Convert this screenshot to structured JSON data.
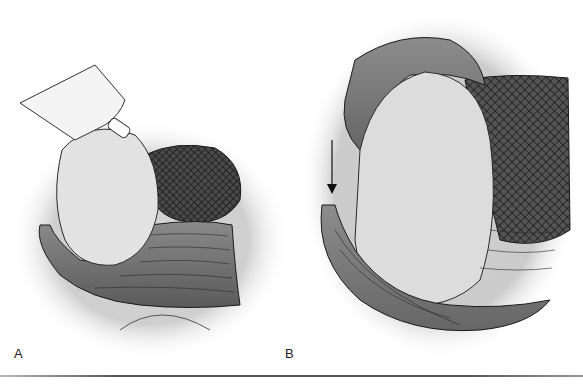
{
  "figure": {
    "panels": [
      {
        "label": "A",
        "description": "Surgical illustration: instrument tip retracting tissue mass beside dark mesh-textured region with fibrous layered tissue below"
      },
      {
        "label": "B",
        "description": "Surgical illustration: larger tissue mass with curved fibrous band, mesh-textured region to right, downward arrow at left edge"
      }
    ],
    "arrow_direction": "down",
    "colors": {
      "background": "#ffffff",
      "halo": "#c8c8c8",
      "tissue_light": "#d8d8d8",
      "tissue_dark": "#6a6a6a",
      "mesh": "#3a3a3a",
      "ink": "#1a1a1a",
      "rule": "#555555"
    }
  }
}
